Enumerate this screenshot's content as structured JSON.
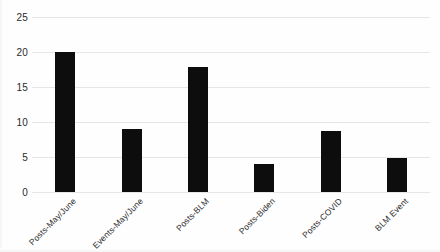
{
  "chart_data": {
    "type": "bar",
    "title": "",
    "subtitle": "",
    "xlabel": "",
    "ylabel": "",
    "categories": [
      "Posts-May/June",
      "Events-May/June",
      "Posts-BLM",
      "Posts-Biden",
      "Posts-COVID",
      "BLM Event"
    ],
    "values": [
      20.0,
      9.0,
      17.8,
      4.0,
      8.7,
      4.8
    ],
    "series": [
      {
        "name": "",
        "values": [
          20.0,
          9.0,
          17.8,
          4.0,
          8.7,
          4.8
        ]
      }
    ],
    "ylim": [
      0,
      25
    ],
    "y_ticks": [
      0,
      5,
      10,
      15,
      20,
      25
    ],
    "y_tick_labels": [
      "0",
      "5",
      "10",
      "15",
      "20",
      "25"
    ],
    "grid": "horizontal",
    "legend": "none",
    "annotations": [],
    "colors": {
      "bar": "#0d0d0d",
      "gridline": "#e6e6e6",
      "background": "#fefefe",
      "text": "#2b2b2b"
    }
  }
}
